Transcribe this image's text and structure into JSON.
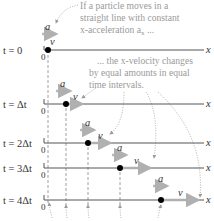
{
  "annotations": {
    "top_note": [
      "If a particle moves in a",
      "straight line with constant",
      "x-acceleration a"
    ],
    "top_note_sub": "x",
    "top_note_tail": " ...",
    "mid_note": [
      "... the x-velocity changes",
      "by equal amounts in equal",
      "time intervals."
    ]
  },
  "axis_label": "x",
  "origin_label": "0",
  "accel_label": "a",
  "velocity_label": "v",
  "rows": [
    {
      "time": "t = 0",
      "y": 50,
      "particle_x": 48,
      "a_x": 40,
      "a_y": 30,
      "v_len": 0
    },
    {
      "time": "t = Δt",
      "y": 104,
      "particle_x": 66,
      "a_x": 58,
      "a_y": 88,
      "v_len": 18
    },
    {
      "time": "t = 2Δt",
      "y": 143,
      "particle_x": 88,
      "a_x": 80,
      "a_y": 126,
      "v_len": 24
    },
    {
      "time": "t = 3Δt",
      "y": 168,
      "particle_x": 120,
      "a_x": 112,
      "a_y": 150,
      "v_len": 30
    },
    {
      "time": "t = 4Δt",
      "y": 200,
      "particle_x": 161,
      "a_x": 153,
      "a_y": 182,
      "v_len": 36
    }
  ],
  "colors": {
    "axis": "#555555",
    "arrow": "#b8b8b8",
    "note": "#9a9a9a",
    "particle": "#000000"
  }
}
